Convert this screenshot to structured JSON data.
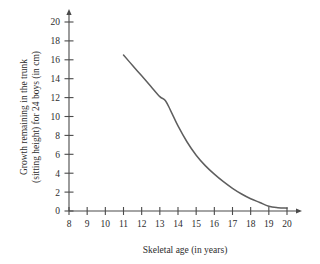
{
  "chart_data": {
    "type": "line",
    "title": "",
    "xlabel": "Skeletal age (in years)",
    "ylabel": "Growth remaining in the trunk (sitting height) for 24 boys (in cm)",
    "ylabel_lines": [
      "Growth remaining in the trunk",
      "(sitting height) for 24 boys (in cm)"
    ],
    "xlim": [
      8,
      20
    ],
    "ylim": [
      0,
      20
    ],
    "xticks": [
      8,
      9,
      10,
      11,
      12,
      13,
      14,
      15,
      16,
      17,
      18,
      19,
      20
    ],
    "yticks": [
      0,
      2,
      4,
      6,
      8,
      10,
      12,
      14,
      16,
      18,
      20
    ],
    "xtick_labels": [
      "8",
      "9",
      "10",
      "11",
      "12",
      "13",
      "14",
      "15",
      "16",
      "17",
      "18",
      "19",
      "20"
    ],
    "ytick_labels": [
      "0",
      "2",
      "4",
      "6",
      "8",
      "10",
      "12",
      "14",
      "16",
      "18",
      "20"
    ],
    "grid": false,
    "legend": false,
    "legend_position": "none",
    "x_axis_arrow": true,
    "y_axis_arrow": true,
    "series": [
      {
        "name": "Growth remaining in the trunk",
        "color": "#5e5e5e",
        "x": [
          11.0,
          11.5,
          12.0,
          12.5,
          13.0,
          13.3,
          13.6,
          14.0,
          14.5,
          15.0,
          15.5,
          16.0,
          16.5,
          17.0,
          17.5,
          18.0,
          18.5,
          19.0,
          19.5,
          20.0
        ],
        "values": [
          16.5,
          15.4,
          14.3,
          13.2,
          12.1,
          11.7,
          10.6,
          9.0,
          7.3,
          5.9,
          4.8,
          3.9,
          3.1,
          2.4,
          1.8,
          1.3,
          0.9,
          0.5,
          0.35,
          0.3
        ]
      }
    ],
    "annotations": []
  },
  "geometry": {
    "origin_x_px": 69,
    "origin_y_px": 211,
    "x_max_px": 287,
    "y_max_px": 22
  },
  "colors": {
    "background": "#ffffff",
    "axis": "#4a4a4a",
    "curve": "#5e5e5e",
    "text": "#2d2d2d"
  }
}
